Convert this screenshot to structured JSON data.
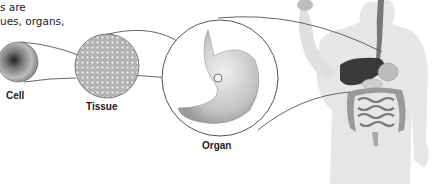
{
  "caption": {
    "line1": "s are",
    "line2": "ues, organs,"
  },
  "labels": {
    "cell": "Cell",
    "tissue": "Tissue",
    "organ": "Organ"
  },
  "figure": {
    "stages": [
      "cell",
      "tissue",
      "organ",
      "organ-system"
    ],
    "colors": {
      "line": "#555555",
      "body": "#e4e4e4",
      "liver": "#3a3a3a",
      "stomach": "#c8c8c8",
      "intestine": "#9a9a9a"
    }
  }
}
